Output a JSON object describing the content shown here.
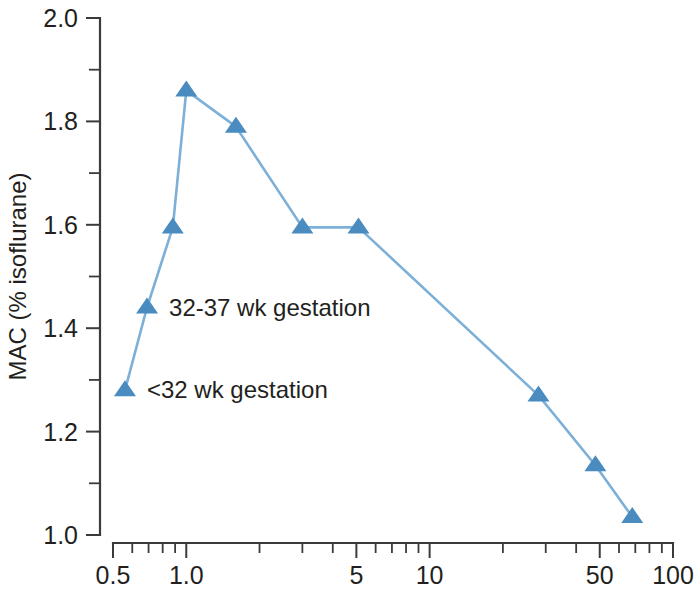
{
  "chart_data": {
    "type": "line",
    "title": "",
    "subtitle": "",
    "xlabel": "Postconceptual age (years)",
    "ylabel": "MAC (% isoflurane)",
    "xscale": "log",
    "yscale": "linear",
    "xlim": [
      0.5,
      100
    ],
    "ylim": [
      1.0,
      2.0
    ],
    "grid": false,
    "legend_position": "none",
    "marker": "triangle-up",
    "x_tick_labels": [
      "0.5",
      "1.0",
      "5",
      "10",
      "50",
      "100"
    ],
    "x_tick_values": [
      0.5,
      1.0,
      5,
      10,
      50,
      100
    ],
    "x_minor_ticks": [
      0.6,
      0.7,
      0.8,
      0.9,
      2,
      3,
      4,
      6,
      7,
      8,
      9,
      20,
      30,
      40,
      60,
      70,
      80,
      90
    ],
    "y_tick_labels": [
      "1.0",
      "1.2",
      "1.4",
      "1.6",
      "1.8",
      "2.0"
    ],
    "y_tick_values": [
      1.0,
      1.2,
      1.4,
      1.6,
      1.8,
      2.0
    ],
    "y_minor_ticks": [
      1.1,
      1.3,
      1.5,
      1.7,
      1.9
    ],
    "series": [
      {
        "name": "MAC isoflurane vs postconceptual age",
        "x": [
          0.56,
          0.69,
          0.88,
          1.0,
          1.6,
          3.0,
          5.1,
          28,
          48,
          68
        ],
        "y": [
          1.28,
          1.44,
          1.595,
          1.86,
          1.79,
          1.595,
          1.595,
          1.27,
          1.135,
          1.035
        ]
      }
    ],
    "annotations": [
      {
        "text": "32-37 wk gestation",
        "x": 0.69,
        "y": 1.44
      },
      {
        "text": "<32 wk gestation",
        "x": 0.56,
        "y": 1.28
      }
    ],
    "colors": {
      "marker": "#4a8cbf",
      "line": "#7cb0d8",
      "axis": "#3b3b3b",
      "text": "#231f20"
    }
  }
}
